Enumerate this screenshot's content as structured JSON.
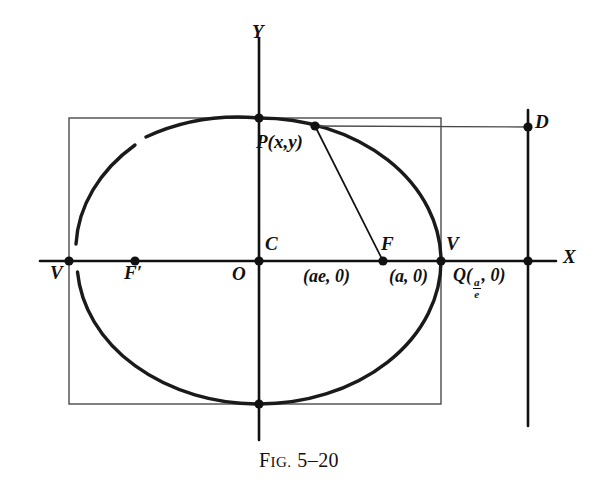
{
  "figure": {
    "caption_prefix": "F",
    "caption_prefix_rest": "IG.",
    "caption_number": "5–20",
    "caption_full": "FIG. 5–20"
  },
  "axes": {
    "x_label": "X",
    "y_label": "Y",
    "x_axis": {
      "y": 261,
      "x_start": 40,
      "x_end": 556
    },
    "y_axis": {
      "x": 259,
      "y_start": 38,
      "y_end": 440
    }
  },
  "curve": {
    "type": "ellipse",
    "center": {
      "x": 259,
      "y": 261
    },
    "semi_major_a": 182,
    "semi_minor_b": 143
  },
  "bounding_rect": {
    "left": 69,
    "top": 118,
    "right": 441,
    "bottom": 404
  },
  "directrix": {
    "x": 528,
    "y_start": 110,
    "y_end": 426
  },
  "points": [
    {
      "name": "vertex-left",
      "label": "V",
      "x": 69,
      "y": 261,
      "label_x": 53,
      "label_y": 271,
      "dot": true
    },
    {
      "name": "focus-left",
      "label": "F′",
      "x": 135,
      "y": 261,
      "label_x": 126,
      "label_y": 271,
      "dot": true
    },
    {
      "name": "center",
      "label": "C",
      "x": 259,
      "y": 261,
      "label_x": 266,
      "label_y": 232,
      "dot": true
    },
    {
      "name": "origin",
      "label": "O",
      "x": 259,
      "y": 261,
      "label_x": 233,
      "label_y": 271,
      "dot": false
    },
    {
      "name": "focus-right",
      "label": "F",
      "x": 383,
      "y": 261,
      "label_x": 384,
      "label_y": 234,
      "dot": true
    },
    {
      "name": "vertex-right",
      "label": "V",
      "x": 441,
      "y": 261,
      "label_x": 447,
      "label_y": 233,
      "dot": true
    },
    {
      "name": "directrix-foot",
      "label": "Q",
      "x": 528,
      "y": 261,
      "label_x": 455,
      "label_y": 270,
      "dot": true
    },
    {
      "name": "directrix-point",
      "label": "D",
      "x": 528,
      "y": 127,
      "label_x": 536,
      "label_y": 117,
      "dot": true
    },
    {
      "name": "point-p",
      "label": "P",
      "x": 315,
      "y": 126,
      "label_x": 259,
      "label_y": 140,
      "dot": true
    },
    {
      "name": "minor-top",
      "label": "",
      "x": 259,
      "y": 118,
      "dot": true
    },
    {
      "name": "minor-bottom",
      "label": "",
      "x": 259,
      "y": 404,
      "dot": true
    }
  ],
  "labels": {
    "point_p": "P(x,y)",
    "focus_coord": "(ae, 0)",
    "vertex_coord": "(a, 0)",
    "q_prefix": "Q(",
    "q_num": "a",
    "q_den": "e",
    "q_suffix": ", 0)",
    "q_full": "Q(a/e, 0)",
    "vertex_left": "V",
    "vertex_right": "V",
    "focus_left": "F′",
    "focus_right": "F",
    "center": "C",
    "origin": "O",
    "directrix_point": "D"
  },
  "segments": [
    {
      "name": "focal-radius-pf",
      "from": {
        "x": 315,
        "y": 126
      },
      "to": {
        "x": 383,
        "y": 261
      }
    },
    {
      "name": "directrix-distance-pd",
      "from": {
        "x": 315,
        "y": 126
      },
      "to": {
        "x": 528,
        "y": 127
      }
    }
  ],
  "colors": {
    "ink": "#111111",
    "curve": "#1a1a1a",
    "thin_line": "#4a4a4a",
    "background": "#ffffff"
  }
}
